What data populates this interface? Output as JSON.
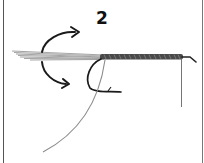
{
  "diagram": {
    "type": "instructional-illustration",
    "step_number": "2",
    "elements": [
      {
        "name": "tail-fibers",
        "description": "gray feather fibers extending left from hook shank"
      },
      {
        "name": "wrapped-body",
        "description": "dark wrapped material along hook shank"
      },
      {
        "name": "hook",
        "description": "fishing hook with bend and barb below shank"
      },
      {
        "name": "rotation-arrow-up",
        "description": "curved arrow pointing up and right"
      },
      {
        "name": "rotation-arrow-down",
        "description": "curved arrow pointing down and right"
      },
      {
        "name": "tying-thread",
        "description": "thin vertical thread hanging near hook eye"
      },
      {
        "name": "loose-strand",
        "description": "long gray strand curving down to the lower left"
      }
    ],
    "colors": {
      "ink": "#1a1a1a",
      "fiber_gray": "#9a9a9a",
      "body_dark": "#3a3a3a",
      "strand_gray": "#8c8c8c",
      "border": "#555555",
      "background": "#ffffff"
    }
  }
}
